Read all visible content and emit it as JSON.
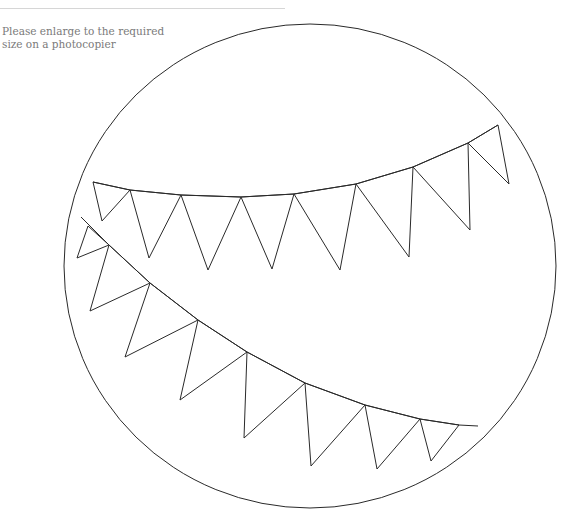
{
  "header": {
    "rule_visible": true
  },
  "instruction": {
    "lines": [
      "Please enlarge to the required",
      "size on a photocopier"
    ],
    "color": "#7a7a7a"
  },
  "template": {
    "outline": {
      "shape": "circle",
      "cx": 310,
      "cy": 266,
      "rx": 246,
      "ry": 242,
      "stroke": "#2a2a2a"
    },
    "bunting": [
      {
        "name": "upper-bunting",
        "string": [
          [
            93,
            182
          ],
          [
            130,
            190
          ],
          [
            181,
            195
          ],
          [
            241,
            197
          ],
          [
            294,
            194
          ],
          [
            356,
            184
          ],
          [
            413,
            167
          ],
          [
            468,
            143
          ],
          [
            498,
            125
          ]
        ],
        "flags": [
          [
            [
              93,
              182
            ],
            [
              102,
              221
            ],
            [
              130,
              190
            ]
          ],
          [
            [
              130,
              190
            ],
            [
              149,
              258
            ],
            [
              181,
              195
            ]
          ],
          [
            [
              181,
              195
            ],
            [
              208,
              270
            ],
            [
              241,
              197
            ]
          ],
          [
            [
              241,
              197
            ],
            [
              272,
              269
            ],
            [
              294,
              194
            ]
          ],
          [
            [
              294,
              194
            ],
            [
              340,
              270
            ],
            [
              356,
              184
            ]
          ],
          [
            [
              356,
              184
            ],
            [
              409,
              257
            ],
            [
              413,
              167
            ]
          ],
          [
            [
              413,
              167
            ],
            [
              470,
              230
            ],
            [
              468,
              143
            ]
          ],
          [
            [
              468,
              143
            ],
            [
              509,
              184
            ],
            [
              498,
              125
            ]
          ]
        ]
      },
      {
        "name": "lower-bunting",
        "string": [
          [
            81,
            217
          ],
          [
            109,
            245
          ],
          [
            150,
            283
          ],
          [
            198,
            320
          ],
          [
            247,
            352
          ],
          [
            305,
            383
          ],
          [
            365,
            405
          ],
          [
            420,
            419
          ],
          [
            459,
            425
          ],
          [
            478,
            426
          ]
        ],
        "flags": [
          [
            [
              88,
              226
            ],
            [
              77,
              258
            ],
            [
              109,
              245
            ]
          ],
          [
            [
              109,
              245
            ],
            [
              90,
              311
            ],
            [
              150,
              283
            ]
          ],
          [
            [
              150,
              283
            ],
            [
              125,
              357
            ],
            [
              198,
              320
            ]
          ],
          [
            [
              198,
              320
            ],
            [
              180,
              400
            ],
            [
              247,
              352
            ]
          ],
          [
            [
              247,
              352
            ],
            [
              244,
              438
            ],
            [
              305,
              383
            ]
          ],
          [
            [
              305,
              383
            ],
            [
              311,
              466
            ],
            [
              365,
              405
            ]
          ],
          [
            [
              365,
              405
            ],
            [
              377,
              469
            ],
            [
              420,
              419
            ]
          ],
          [
            [
              420,
              419
            ],
            [
              431,
              461
            ],
            [
              459,
              425
            ]
          ]
        ]
      }
    ]
  }
}
